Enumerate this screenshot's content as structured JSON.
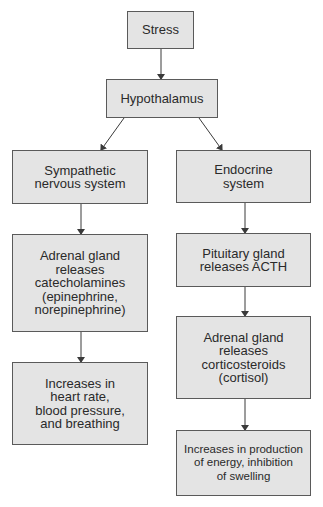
{
  "diagram": {
    "colors": {
      "box_fill": "#e4e4e4",
      "box_border": "#5a5a5a",
      "arrow": "#3a3a3a",
      "text": "#2a2a2a"
    },
    "nodes": {
      "stress": "Stress",
      "hypothalamus": "Hypothalamus",
      "sympathetic": "Sympathetic\nnervous system",
      "endocrine": "Endocrine\nsystem",
      "adrenal_catecholamines": "Adrenal gland\nreleases\ncatecholamines\n(epinephrine,\nnorepinephrine)",
      "pituitary": "Pituitary gland\nreleases ACTH",
      "heart_rate": "Increases in\nheart rate,\nblood pressure,\nand breathing",
      "adrenal_corticosteroids": "Adrenal gland\nreleases\ncorticosteroids\n(cortisol)",
      "energy": "Increases in production\nof energy, inhibition\nof swelling"
    },
    "edges": [
      {
        "from": "stress",
        "to": "hypothalamus"
      },
      {
        "from": "hypothalamus",
        "to": "sympathetic"
      },
      {
        "from": "hypothalamus",
        "to": "endocrine"
      },
      {
        "from": "sympathetic",
        "to": "adrenal_catecholamines"
      },
      {
        "from": "adrenal_catecholamines",
        "to": "heart_rate"
      },
      {
        "from": "endocrine",
        "to": "pituitary"
      },
      {
        "from": "pituitary",
        "to": "adrenal_corticosteroids"
      },
      {
        "from": "adrenal_corticosteroids",
        "to": "energy"
      }
    ]
  }
}
